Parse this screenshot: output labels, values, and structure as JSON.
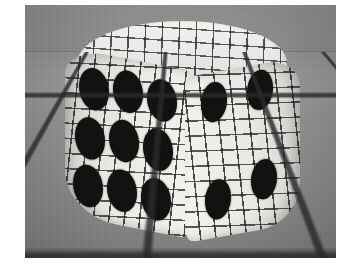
{
  "image": {
    "title": "Wireframe-rendered rounded die on checkered ground plane",
    "rendering_style": "grayscale 3d wireframe mesh render",
    "color_mode": "grayscale",
    "frame": {
      "x": 25,
      "y": 5,
      "width": 311,
      "height": 253,
      "page_background": "#ffffff",
      "border": "none"
    }
  },
  "scene": {
    "background": {
      "sky_color": "#8d8d8d",
      "horizon_y": 46,
      "horizon_color": "#6f6f6f"
    },
    "ground": {
      "name": "checkered-ground-plane",
      "color": "#8c8c8c",
      "grid_line_color": "#282828",
      "perspective": "single-point, receding to horizon",
      "grid_spacing_px": 40
    }
  },
  "object": {
    "name": "die",
    "shape": "rounded cube with deformed / bulging mesh surface",
    "surface_color": "#e9e9e6",
    "wireframe_color": "#1e1e1e",
    "pip_color": "#111110",
    "faces": [
      {
        "id": "top",
        "label": "Top face",
        "pip_count": 0,
        "note": "blank - wireframe mesh only, no pips visible",
        "pips": []
      },
      {
        "id": "left",
        "label": "Front-left face",
        "pip_count": 9,
        "note": "3 x 3 grid of elliptical pips",
        "pips": [
          {
            "x": 14,
            "y": 16
          },
          {
            "x": 48,
            "y": 12
          },
          {
            "x": 82,
            "y": 14
          },
          {
            "x": 10,
            "y": 66
          },
          {
            "x": 44,
            "y": 62
          },
          {
            "x": 78,
            "y": 64
          },
          {
            "x": 8,
            "y": 114
          },
          {
            "x": 42,
            "y": 112
          },
          {
            "x": 76,
            "y": 114
          }
        ]
      },
      {
        "id": "right",
        "label": "Right face",
        "pip_count": 4,
        "note": "four corner pips",
        "pips": [
          {
            "x": 16,
            "y": 10
          },
          {
            "x": 62,
            "y": 6
          },
          {
            "x": 20,
            "y": 108
          },
          {
            "x": 66,
            "y": 96
          }
        ]
      }
    ],
    "total_visible_pips": 13
  }
}
